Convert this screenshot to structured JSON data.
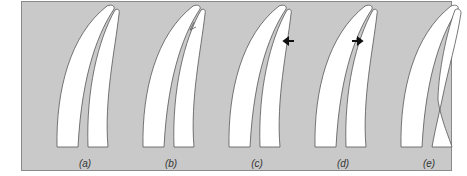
{
  "figure": {
    "panels": [
      {
        "label": "(a)",
        "description": "intact paired curved blades"
      },
      {
        "label": "(b)",
        "description": "notch in inner blade"
      },
      {
        "label": "(c)",
        "description": "crack with left-pointing arrow"
      },
      {
        "label": "(d)",
        "description": "broken tip with right-pointing arrow"
      },
      {
        "label": "(e)",
        "description": "blades separated at junction"
      }
    ],
    "colors": {
      "background": "#c9c9c9",
      "shape": "#ffffff",
      "outline": "#555555",
      "arrow": "#111111"
    }
  }
}
